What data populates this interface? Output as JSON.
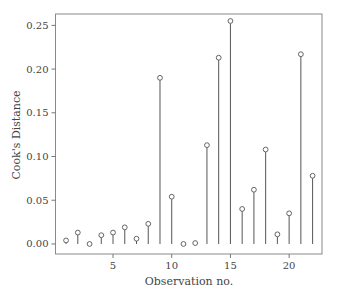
{
  "chart_data": {
    "type": "scatter",
    "subtype": "stem",
    "title": "",
    "xlabel": "Observation no.",
    "ylabel": "Cook's Distance",
    "xlim": [
      0.1,
      22.8
    ],
    "ylim": [
      -0.0115,
      0.263
    ],
    "x_ticks": [
      5,
      10,
      15,
      20
    ],
    "x_tick_labels": [
      "5",
      "10",
      "15",
      "20"
    ],
    "y_ticks": [
      0.0,
      0.05,
      0.1,
      0.15,
      0.2,
      0.25
    ],
    "y_tick_labels": [
      "0.00",
      "0.05",
      "0.10",
      "0.15",
      "0.20",
      "0.25"
    ],
    "grid": false,
    "legend": null,
    "x": [
      1,
      2,
      3,
      4,
      5,
      6,
      7,
      8,
      9,
      10,
      11,
      12,
      13,
      14,
      15,
      16,
      17,
      18,
      19,
      20,
      21,
      22
    ],
    "values": [
      0.004,
      0.013,
      0.0,
      0.01,
      0.013,
      0.019,
      0.006,
      0.023,
      0.19,
      0.054,
      0.0,
      0.001,
      0.113,
      0.213,
      0.255,
      0.04,
      0.062,
      0.108,
      0.011,
      0.035,
      0.217,
      0.078
    ]
  },
  "colors": {
    "frame": "#8a8a8a",
    "stem": "#555555",
    "marker_stroke": "#555555",
    "text": "#444444"
  }
}
